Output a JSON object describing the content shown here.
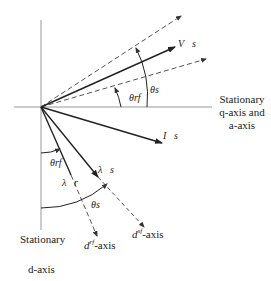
{
  "diagram": {
    "type": "phasor-vector-diagram",
    "axes": {
      "q_axis_label_line1": "Stationary",
      "q_axis_label_line2": "q-axis and",
      "q_axis_label_line3": "a-axis",
      "d_axis_label_line1": "Stationary",
      "d_axis_label_line2": "d-axis",
      "d_rf_axis_label": "d",
      "d_rf_axis_sup": "rf",
      "d_rf_axis_suffix": "-axis",
      "d_sf_axis_label": "d",
      "d_sf_axis_sup": "sf",
      "d_sf_axis_suffix": "-axis"
    },
    "vectors": {
      "v_s": "V⃗s",
      "i_s": "I⃗s",
      "lambda_s": "λ⃗s",
      "lambda_r": "λ⃗r"
    },
    "angles": {
      "theta_rf_top": "θrf",
      "theta_s_top": "θs",
      "theta_rf_bottom": "θrf",
      "theta_s_bottom": "θs"
    },
    "colors": {
      "line": "#222222",
      "axis": "#888888",
      "dashed": "#555555"
    }
  }
}
